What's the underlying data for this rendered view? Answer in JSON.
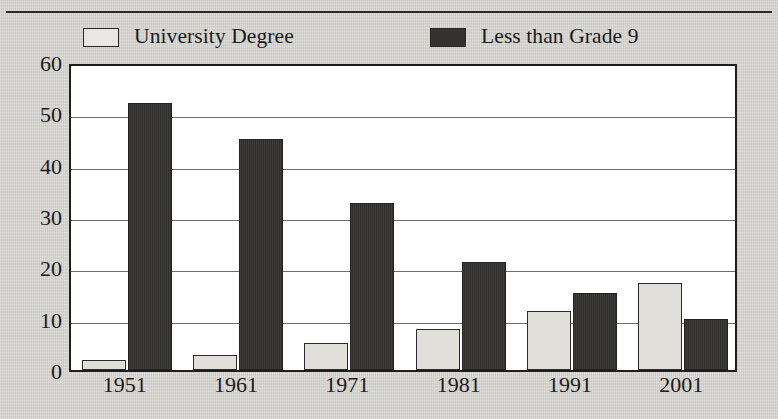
{
  "figure": {
    "background_color": "#d7d5d0",
    "plot_background_color": "#ffffff",
    "frame_color": "#1d1d1d",
    "gridline_color": "#6d6d6d"
  },
  "legend": {
    "position": "top",
    "items": [
      {
        "label": "University Degree",
        "swatch": "light-swatch-icon",
        "color": "#e0dfda"
      },
      {
        "label": "Less than Grade 9",
        "swatch": "dark-swatch-icon",
        "color": "#343331"
      }
    ]
  },
  "chart_data": {
    "type": "bar",
    "title": "",
    "xlabel": "",
    "ylabel": "",
    "categories": [
      "1951",
      "1961",
      "1971",
      "1981",
      "1991",
      "2001"
    ],
    "series": [
      {
        "name": "University Degree",
        "color": "#e0dfda",
        "values": [
          2,
          3,
          5.3,
          8,
          11.5,
          17
        ]
      },
      {
        "name": "Less than Grade 9",
        "color": "#343331",
        "values": [
          52,
          45,
          32.5,
          21,
          15,
          10
        ]
      }
    ],
    "ylim": [
      0,
      60
    ],
    "yticks": [
      0,
      10,
      20,
      30,
      40,
      50,
      60
    ],
    "ytick_labels": [
      "0",
      "10",
      "20",
      "30",
      "40",
      "50",
      "60"
    ],
    "grid": "horizontal",
    "legend_position": "top"
  }
}
